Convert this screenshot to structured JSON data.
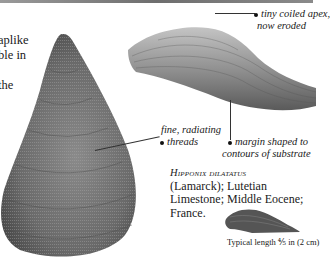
{
  "intro_text": {
    "lines": [
      "aplike",
      "ble in",
      "",
      "the"
    ]
  },
  "annotations": {
    "apex": {
      "line1": "tiny coiled apex,",
      "line2": "now eroded"
    },
    "threads": {
      "line1": "fine, radiating",
      "line2": "threads"
    },
    "margin": {
      "line1": "margin shaped to",
      "line2": "contours of substrate"
    }
  },
  "caption": {
    "species": "Hipponix dilatatus",
    "line1": "(Lamarck); Lutetian",
    "line2": "Limestone; Middle Eocene;",
    "line3": "France."
  },
  "scale": {
    "typical_length": "Typical length ⅘ in (2 cm)"
  },
  "colors": {
    "text": "#1a1a1a",
    "shell_dark": "#5e5e5e",
    "shell_light": "#b8b8b8",
    "background": "#ffffff"
  }
}
